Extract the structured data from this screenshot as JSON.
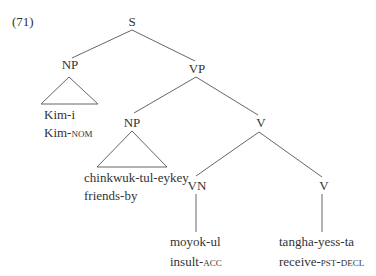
{
  "example_number": "(71)",
  "nodes": {
    "s": "S",
    "np_subject": "NP",
    "vp": "VP",
    "np_adjunct": "NP",
    "v_complex": "V",
    "vn": "VN",
    "v_head": "V"
  },
  "leaves": {
    "subject": {
      "form": "Kim-i",
      "gloss_stem": "Kim-",
      "gloss_tag": "nom"
    },
    "adjunct": {
      "form": "chinkwuk-tul-eykey",
      "gloss": "friends-by"
    },
    "object": {
      "form": "moyok-ul",
      "gloss_stem": "insult-",
      "gloss_tag": "acc"
    },
    "verb": {
      "form": "tangha-yess-ta",
      "gloss_stem": "receive-",
      "gloss_tag": "pst-decl"
    }
  },
  "colors": {
    "line": "#666666",
    "text": "#333333"
  }
}
